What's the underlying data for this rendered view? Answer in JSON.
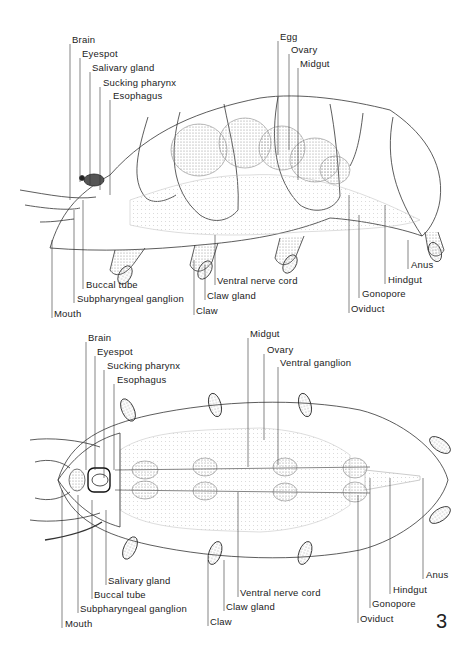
{
  "figure_number": "3",
  "top_view": {
    "name": "lateral view",
    "labels_top": [
      {
        "text": "Brain",
        "x": 72,
        "y": 39
      },
      {
        "text": "Eyespot",
        "x": 82,
        "y": 53
      },
      {
        "text": "Salivary gland",
        "x": 92,
        "y": 67
      },
      {
        "text": "Sucking pharynx",
        "x": 103,
        "y": 82
      },
      {
        "text": "Esophagus",
        "x": 113,
        "y": 95
      },
      {
        "text": "Egg",
        "x": 280,
        "y": 36
      },
      {
        "text": "Ovary",
        "x": 291,
        "y": 49
      },
      {
        "text": "Midgut",
        "x": 300,
        "y": 63
      }
    ],
    "labels_bottom": [
      {
        "text": "Buccal tube",
        "x": 86,
        "y": 284
      },
      {
        "text": "Subpharyngeal ganglion",
        "x": 77,
        "y": 298
      },
      {
        "text": "Mouth",
        "x": 54,
        "y": 313
      },
      {
        "text": "Ventral nerve cord",
        "x": 217,
        "y": 280
      },
      {
        "text": "Claw gland",
        "x": 207,
        "y": 295
      },
      {
        "text": "Claw",
        "x": 196,
        "y": 310
      },
      {
        "text": "Anus",
        "x": 411,
        "y": 264
      },
      {
        "text": "Hindgut",
        "x": 388,
        "y": 279
      },
      {
        "text": "Gonopore",
        "x": 362,
        "y": 293
      },
      {
        "text": "Oviduct",
        "x": 351,
        "y": 308
      }
    ]
  },
  "bottom_view": {
    "name": "ventral view",
    "labels_top": [
      {
        "text": "Brain",
        "x": 88,
        "y": 337
      },
      {
        "text": "Eyespot",
        "x": 97,
        "y": 351
      },
      {
        "text": "Sucking pharynx",
        "x": 107,
        "y": 365
      },
      {
        "text": "Esophagus",
        "x": 117,
        "y": 379
      },
      {
        "text": "Midgut",
        "x": 250,
        "y": 333
      },
      {
        "text": "Ovary",
        "x": 267,
        "y": 349
      },
      {
        "text": "Ventral ganglion",
        "x": 280,
        "y": 362
      }
    ],
    "labels_bottom": [
      {
        "text": "Salivary gland",
        "x": 108,
        "y": 580
      },
      {
        "text": "Buccal tube",
        "x": 94,
        "y": 594
      },
      {
        "text": "Subpharyngeal ganglion",
        "x": 80,
        "y": 608
      },
      {
        "text": "Mouth",
        "x": 65,
        "y": 623
      },
      {
        "text": "Ventral nerve cord",
        "x": 240,
        "y": 592
      },
      {
        "text": "Claw gland",
        "x": 226,
        "y": 606
      },
      {
        "text": "Claw",
        "x": 210,
        "y": 621
      },
      {
        "text": "Anus",
        "x": 426,
        "y": 574
      },
      {
        "text": "Hindgut",
        "x": 393,
        "y": 589
      },
      {
        "text": "Gonopore",
        "x": 372,
        "y": 603
      },
      {
        "text": "Oviduct",
        "x": 360,
        "y": 618
      }
    ]
  },
  "colors": {
    "ink": "#222222",
    "stipple": "#bdbdbd",
    "organ": "#9a9a9a",
    "background": "#ffffff"
  }
}
